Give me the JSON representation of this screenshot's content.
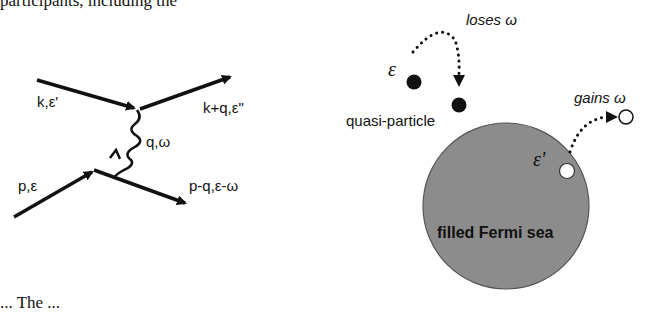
{
  "caption_fragments": {
    "top": "participants, including the",
    "bottom": "... The ..."
  },
  "feynman_diagram": {
    "incoming_top_label": "k,ε'",
    "outgoing_top_label": "k+q,ε\"",
    "boson_label": "q,ω",
    "incoming_bottom_label": "p,ε",
    "outgoing_bottom_label": "p-q,ε-ω"
  },
  "fermi_sea_diagram": {
    "loses_label": "loses ω",
    "gains_label": "gains ω",
    "epsilon_label": "ε",
    "epsilon_prime_label": "ε'",
    "quasiparticle_label": "quasi-particle",
    "sea_label": "filled Fermi sea",
    "colors": {
      "sea_fill": "#8c8c8c",
      "particle_fill": "#111111",
      "hole_fill": "#ffffff"
    }
  }
}
